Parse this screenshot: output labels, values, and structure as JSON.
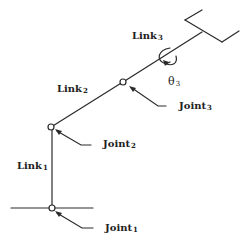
{
  "diagram": {
    "type": "robot-arm-kinematic-schematic",
    "colors": {
      "line": "#2a2a2a",
      "background": "#ffffff"
    },
    "links": [
      {
        "id": "link1",
        "base": "Link",
        "sub": "1"
      },
      {
        "id": "link2",
        "base": "Link",
        "sub": "2"
      },
      {
        "id": "link3",
        "base": "Link",
        "sub": "3"
      }
    ],
    "joints": [
      {
        "id": "joint1",
        "base": "Joint",
        "sub": "1"
      },
      {
        "id": "joint2",
        "base": "Joint",
        "sub": "2"
      },
      {
        "id": "joint3",
        "base": "Joint",
        "sub": "3"
      }
    ],
    "rotation": {
      "symbol": "θ",
      "sub": "3"
    },
    "end_effector": "gripper"
  }
}
